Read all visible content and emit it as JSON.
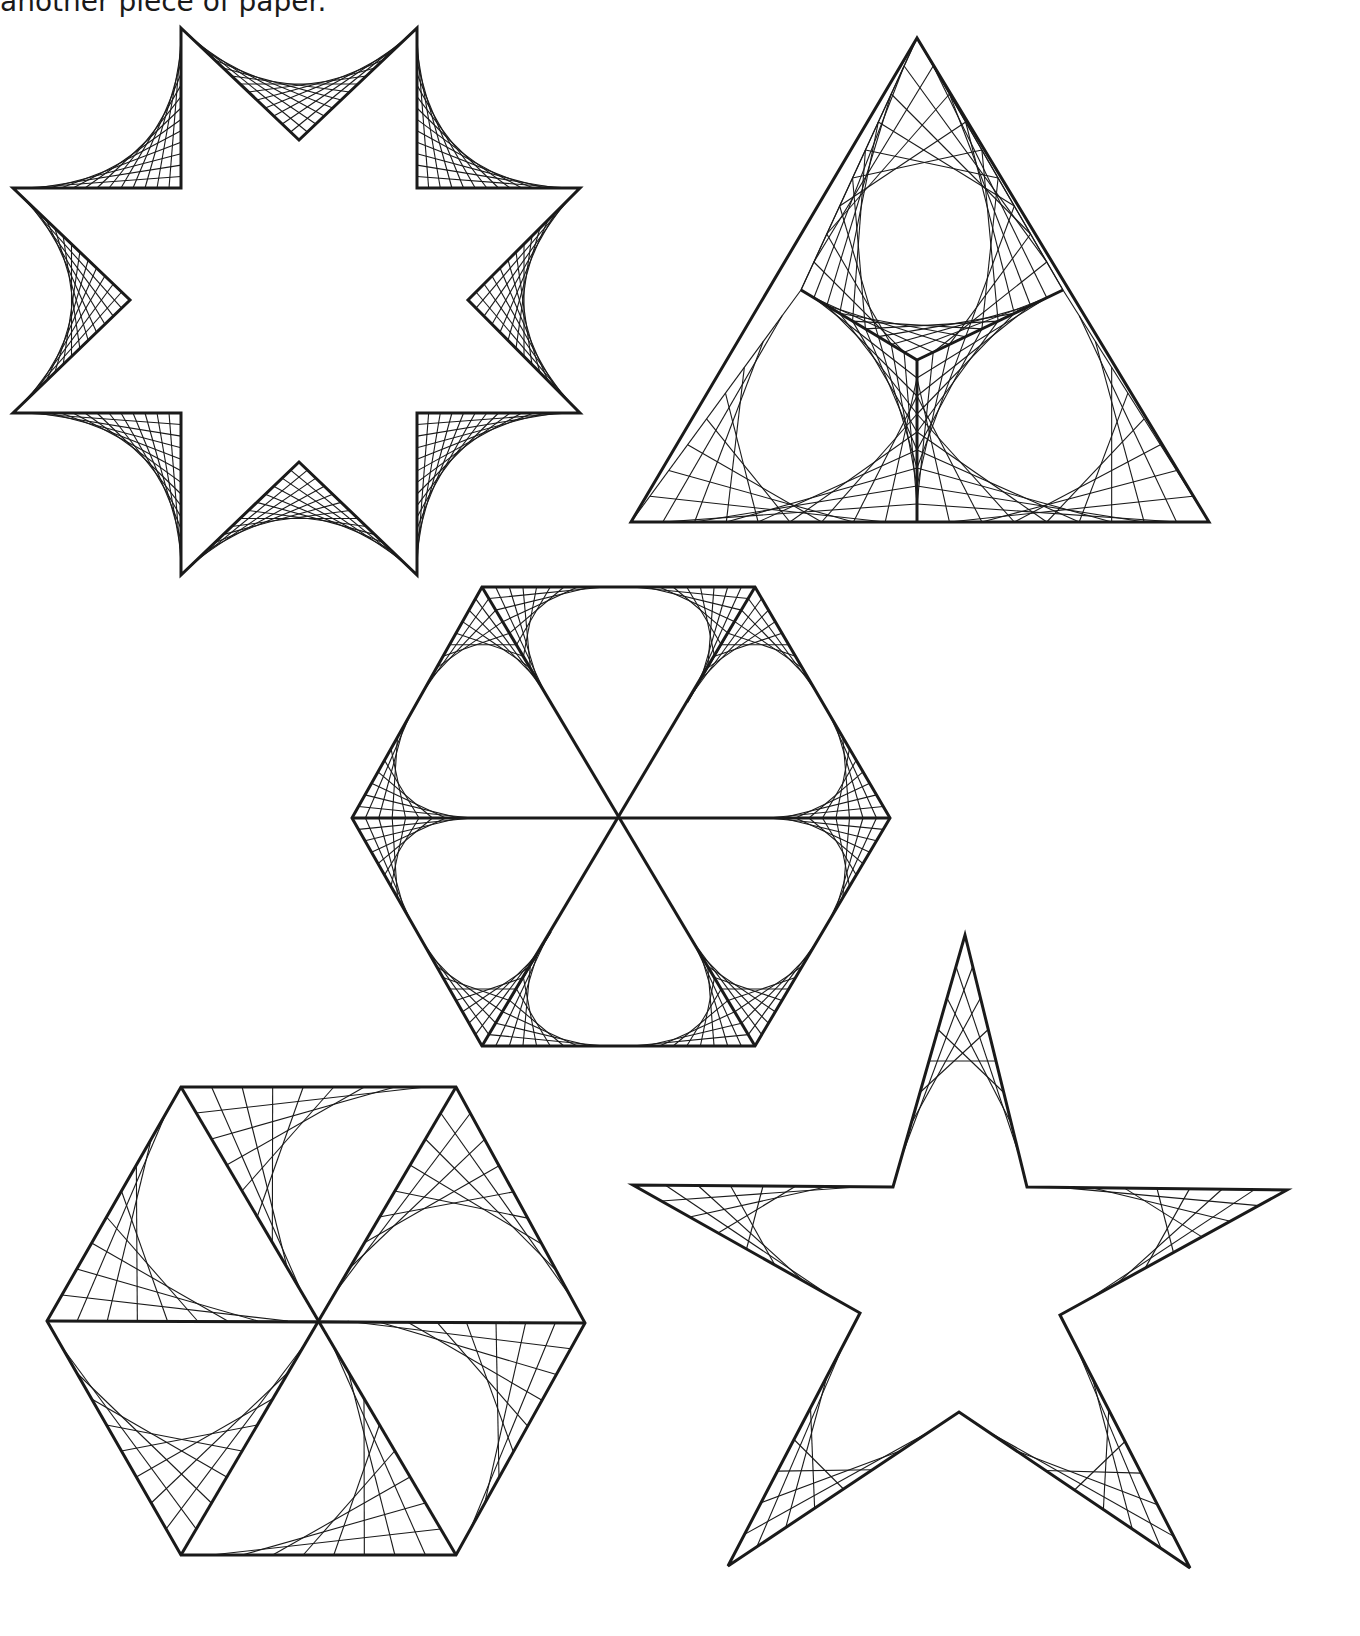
{
  "page": {
    "caption": "another piece of paper.",
    "ink_color": "#1a1a1a",
    "background": "#ffffff"
  },
  "figures": [
    {
      "id": "eight-point-star",
      "label": "Eight-pointed star with curve-stitched corners",
      "threads_per_corner": 14
    },
    {
      "id": "triangle-y",
      "label": "Triangle divided by a Y with curve-stitched regions",
      "threads_per_corner": 9
    },
    {
      "id": "hexagon-flower",
      "label": "Hexagon of six triangles with curve-stitched corners forming petals",
      "threads_per_corner": 10
    },
    {
      "id": "hexagon-pinwheel",
      "label": "Hexagon of six triangles with pinwheel curve stitching",
      "threads_per_corner": 9
    },
    {
      "id": "five-point-star",
      "label": "Five-pointed star with curve-stitched points",
      "threads_per_corner": 8
    }
  ]
}
